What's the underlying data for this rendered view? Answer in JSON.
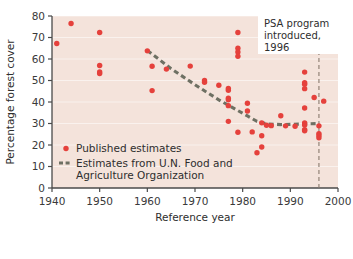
{
  "chart_data": {
    "type": "scatter",
    "title": "",
    "xlabel": "Reference year",
    "ylabel": "Percentage forest cover",
    "xlim": [
      1940,
      2000
    ],
    "ylim": [
      0,
      80
    ],
    "xticks": [
      1940,
      1950,
      1960,
      1970,
      1980,
      1990,
      2000
    ],
    "xticklabels": [
      "1940",
      "1950",
      "1960",
      "1970",
      "1980",
      "1990",
      "2000"
    ],
    "yticks": [
      0,
      10,
      20,
      30,
      40,
      50,
      60,
      70,
      80
    ],
    "yticklabels": [
      "0",
      "10",
      "20",
      "30",
      "40",
      "50",
      "60",
      "70",
      "80"
    ],
    "grid": "horizontal-faint",
    "plot_background": "#f4e3db",
    "legend_position": "lower-left-inside",
    "series": [
      {
        "name": "Published estimates",
        "type": "scatter",
        "marker": "circle",
        "color": "#e5413c",
        "points": [
          [
            1941,
            67.2
          ],
          [
            1944,
            76.5
          ],
          [
            1950,
            72.3
          ],
          [
            1950,
            57.0
          ],
          [
            1950,
            54.0
          ],
          [
            1950,
            53.2
          ],
          [
            1960,
            63.8
          ],
          [
            1961,
            56.6
          ],
          [
            1961,
            45.3
          ],
          [
            1964,
            55.3
          ],
          [
            1969,
            56.7
          ],
          [
            1972,
            50.0
          ],
          [
            1972,
            49.2
          ],
          [
            1975,
            47.8
          ],
          [
            1977,
            46.3
          ],
          [
            1977,
            45.5
          ],
          [
            1977,
            41.8
          ],
          [
            1977,
            41.0
          ],
          [
            1977,
            38.3
          ],
          [
            1977,
            31.0
          ],
          [
            1979,
            72.3
          ],
          [
            1979,
            65.0
          ],
          [
            1979,
            63.3
          ],
          [
            1979,
            61.3
          ],
          [
            1979,
            25.9
          ],
          [
            1981,
            39.4
          ],
          [
            1981,
            35.8
          ],
          [
            1982,
            26.1
          ],
          [
            1983,
            16.4
          ],
          [
            1984,
            19.1
          ],
          [
            1984,
            30.3
          ],
          [
            1984,
            24.3
          ],
          [
            1985,
            29.2
          ],
          [
            1986,
            29.0
          ],
          [
            1988,
            33.6
          ],
          [
            1989,
            28.9
          ],
          [
            1991,
            28.7
          ],
          [
            1993,
            53.9
          ],
          [
            1993,
            49.0
          ],
          [
            1993,
            48.3
          ],
          [
            1993,
            46.2
          ],
          [
            1993,
            37.2
          ],
          [
            1993,
            30.2
          ],
          [
            1993,
            29.3
          ],
          [
            1993,
            27.1
          ],
          [
            1993,
            26.6
          ],
          [
            1995,
            42.1
          ],
          [
            1996,
            28.9
          ],
          [
            1996,
            25.3
          ],
          [
            1996,
            24.4
          ],
          [
            1996,
            23.4
          ],
          [
            1997,
            40.4
          ]
        ]
      },
      {
        "name": "Estimates from U.N. Food and Agriculture Organization",
        "type": "line",
        "linestyle": "dashed",
        "color": "#6e7063",
        "points": [
          [
            1960,
            64.0
          ],
          [
            1965,
            55.5
          ],
          [
            1970,
            48.0
          ],
          [
            1975,
            41.0
          ],
          [
            1977,
            38.5
          ],
          [
            1979,
            36.0
          ],
          [
            1981,
            33.5
          ],
          [
            1983,
            31.0
          ],
          [
            1985,
            29.8
          ],
          [
            1988,
            29.5
          ],
          [
            1990,
            29.6
          ],
          [
            1993,
            29.8
          ],
          [
            1996,
            30.0
          ]
        ]
      }
    ],
    "annotations": [
      {
        "name": "psa-program-note",
        "lines": [
          "PSA program",
          "introduced,",
          "1996"
        ],
        "x": 1996,
        "marker_line": "vertical-dashed"
      }
    ],
    "reference_lines": [
      {
        "name": "psa-1996-line",
        "orientation": "vertical",
        "x": 1996,
        "style": "dashed",
        "color": "#8a7b6e"
      }
    ]
  },
  "legend": {
    "items": [
      {
        "label": "Published estimates",
        "symbol": "dot",
        "color": "#e5413c"
      },
      {
        "label": "Estimates from U.N. Food and",
        "label2": "Agriculture Organization",
        "symbol": "dashes",
        "color": "#6e7063"
      }
    ]
  }
}
